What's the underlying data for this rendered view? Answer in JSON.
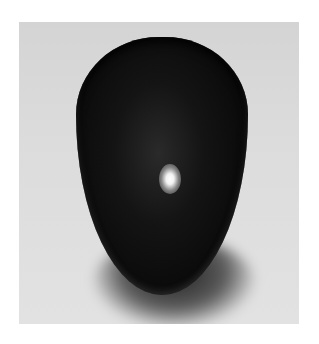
{
  "image": {
    "subject": "black computer mouse",
    "background_color": "#dcdcdc",
    "frame_color": "#ffffff",
    "object_color": "#0a0a0a",
    "highlight_color": "#ffffff"
  }
}
